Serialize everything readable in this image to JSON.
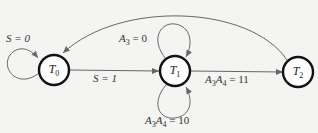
{
  "diagram": {
    "type": "state-diagram",
    "nodes": [
      {
        "id": "T0",
        "label": "T",
        "sub": "0"
      },
      {
        "id": "T1",
        "label": "T",
        "sub": "1"
      },
      {
        "id": "T2",
        "label": "T",
        "sub": "2"
      }
    ],
    "edges": [
      {
        "from": "T0",
        "to": "T0",
        "label": "S = 0"
      },
      {
        "from": "T0",
        "to": "T1",
        "label": "S = 1"
      },
      {
        "from": "T1",
        "to": "T1",
        "label": "A3 = 0",
        "position": "top"
      },
      {
        "from": "T1",
        "to": "T1",
        "label": "A3A4 = 10",
        "position": "bottom"
      },
      {
        "from": "T1",
        "to": "T2",
        "label": "A3A4 = 11"
      },
      {
        "from": "T2",
        "to": "T0",
        "label": ""
      }
    ]
  },
  "labels": {
    "t0_var": "T",
    "t0_sub": "0",
    "t1_var": "T",
    "t1_sub": "1",
    "t2_var": "T",
    "t2_sub": "2",
    "s0": "S = 0",
    "s1": "S = 1",
    "a3_var": "A",
    "a3_sub": "3",
    "a3_rest": " = 0",
    "a34_11_rest": " = 11",
    "a34_10_rest": " = 10",
    "a_var": "A",
    "sub3": "3",
    "sub4": "4"
  }
}
